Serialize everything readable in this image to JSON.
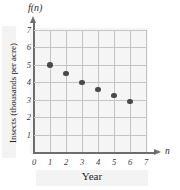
{
  "chart_data": {
    "type": "scatter",
    "title": "",
    "xlabel": "Year",
    "ylabel": "Insects (thousands per acre)",
    "y_axis_symbol": "f(n)",
    "x_axis_symbol": "n",
    "xlim": [
      0,
      7
    ],
    "ylim": [
      0,
      7
    ],
    "grid": true,
    "legend": "none",
    "x_ticks": [
      "0",
      "1",
      "2",
      "3",
      "4",
      "5",
      "6",
      "7"
    ],
    "y_ticks": [
      "1",
      "2",
      "3",
      "4",
      "5",
      "6",
      "7"
    ],
    "x": [
      1,
      2,
      3,
      4,
      5,
      6
    ],
    "values": [
      5,
      4.5,
      4,
      3.6,
      3.25,
      2.9
    ],
    "point_labels": [
      "(1, 5)",
      "(2, 4.5)",
      "(3, 4)",
      "(4, 3.6)",
      "(5, 3.25)",
      "(6, 2.9)"
    ],
    "colors": {
      "point": "#4a4a4a",
      "grid": "#c4c4c4",
      "axis": "#6e6e6e",
      "tint": "#e9e9e9"
    }
  }
}
